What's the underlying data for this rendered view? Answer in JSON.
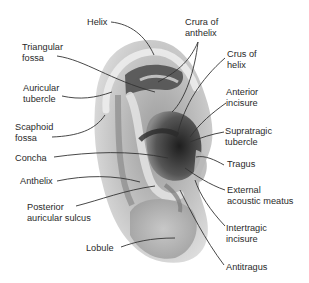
{
  "figure": {
    "labels": {
      "helix": "Helix",
      "triangular_fossa": "Triangular\nfossa",
      "auricular_tubercle": "Auricular\ntubercle",
      "scaphoid_fossa": "Scaphoid\nfossa",
      "concha": "Concha",
      "anthelix": "Anthelix",
      "posterior_auricular_sulcus": "Posterior\nauricular sulcus",
      "lobule": "Lobule",
      "crura_of_anthelix": "Crura of\nanthelix",
      "crus_of_helix": "Crus of\nhelix",
      "anterior_incisure": "Anterior\nincisure",
      "supratragic_tubercle": "Supratragic\ntubercle",
      "tragus": "Tragus",
      "external_acoustic_meatus": "External\nacoustic meatus",
      "intertragic_incisure": "Intertragic\nincisure",
      "antitragus": "Antitragus"
    },
    "colors": {
      "text": "#2a2a2a",
      "leader": "#333333",
      "ear_light": "#e6e6e6",
      "ear_mid": "#a8a8a8",
      "ear_dark": "#3c3c3c"
    }
  }
}
